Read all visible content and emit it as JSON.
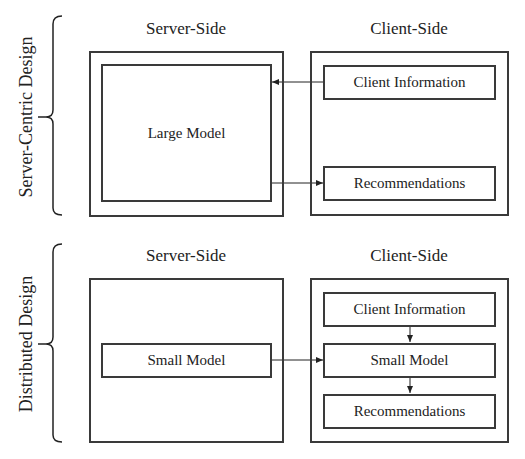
{
  "sections": [
    {
      "title": "Server-Centric Design",
      "server": {
        "label": "Server-Side",
        "nodes": [
          "Large Model"
        ]
      },
      "client": {
        "label": "Client-Side",
        "nodes": [
          "Client Information",
          "Recommendations"
        ]
      },
      "edges": [
        {
          "from": "Client Information",
          "to": "Large Model"
        },
        {
          "from": "Large Model",
          "to": "Recommendations"
        }
      ]
    },
    {
      "title": "Distributed Design",
      "server": {
        "label": "Server-Side",
        "nodes": [
          "Small Model"
        ]
      },
      "client": {
        "label": "Client-Side",
        "nodes": [
          "Client Information",
          "Small Model",
          "Recommendations"
        ]
      },
      "edges": [
        {
          "from": "Small Model (server)",
          "to": "Small Model (client)"
        },
        {
          "from": "Client Information",
          "to": "Small Model (client)"
        },
        {
          "from": "Small Model (client)",
          "to": "Recommendations"
        }
      ]
    }
  ],
  "colors": {
    "stroke": "#3a3a3a",
    "text": "#222222",
    "background": "#ffffff"
  }
}
